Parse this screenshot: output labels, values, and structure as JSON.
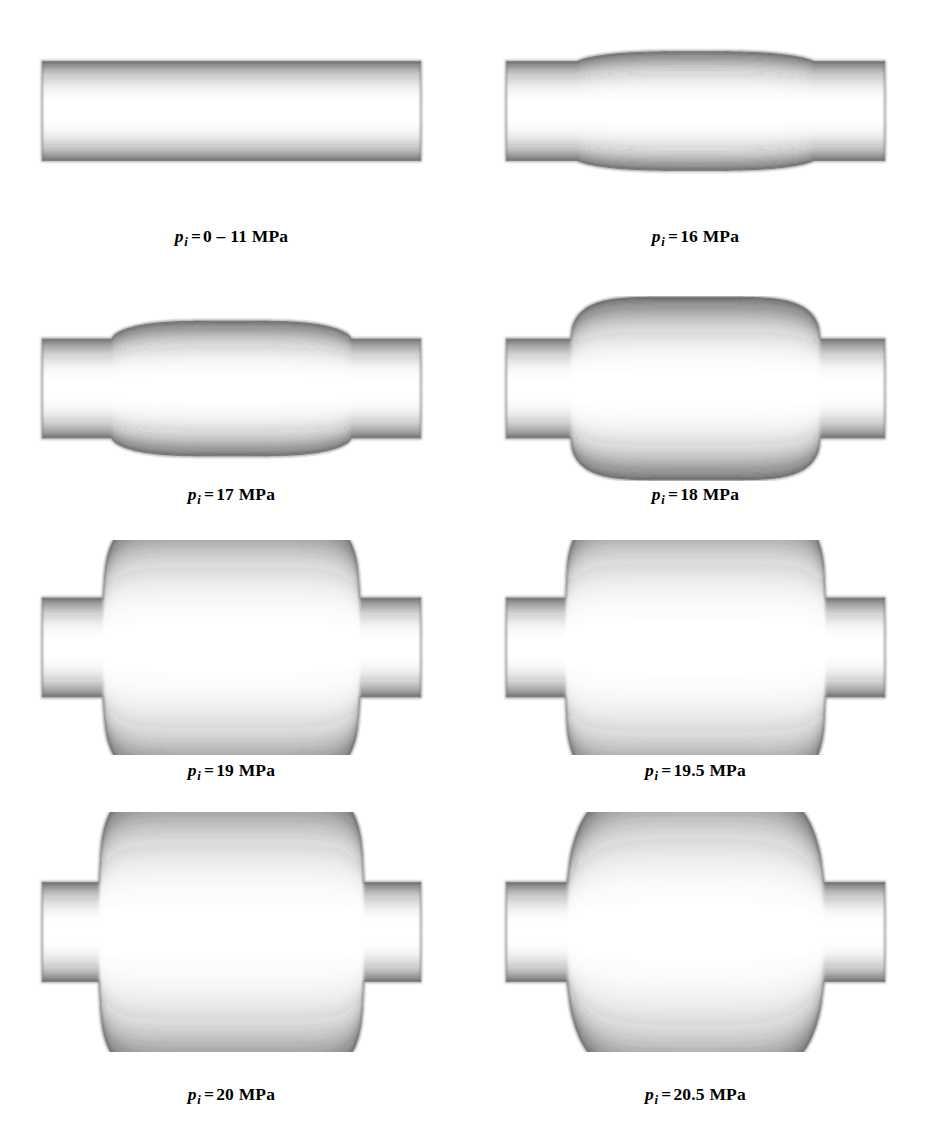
{
  "figure": {
    "kind": "tube-bulge-simulation-grid",
    "columns": 2,
    "rows": 4,
    "background_color": "#ffffff",
    "ink_color": "#2b2b2b"
  },
  "chart_data": {
    "type": "diagram-series",
    "title": "",
    "xlabel": "",
    "ylabel": "",
    "quantity_symbol": "p",
    "quantity_subscript": "i",
    "unit": "MPa",
    "categories": [
      "0 – 11",
      "16",
      "17",
      "18",
      "19",
      "19.5",
      "20",
      "20.5"
    ],
    "values": [
      0,
      16,
      17,
      18,
      19,
      19.5,
      20,
      20.5
    ],
    "bulge_half_height_px": [
      0,
      10,
      18,
      42,
      80,
      86,
      92,
      100
    ],
    "bulge_half_width_px": [
      0,
      118,
      120,
      125,
      128,
      130,
      132,
      128
    ]
  },
  "panels": [
    {
      "id": "p0",
      "symbol": "p",
      "subscript": "i",
      "equals": "=",
      "value": "0 – 11",
      "unit": "MPa",
      "caption": "p i = 0 – 11 MPa",
      "pressure_mpa": 0,
      "shape": "straight",
      "bulge_half_height": 0,
      "bulge_half_width": 0,
      "neck_width": 0,
      "tube_half_height": 50,
      "flat_top": 0
    },
    {
      "id": "p16",
      "symbol": "p",
      "subscript": "i",
      "equals": "=",
      "value": "16",
      "unit": "MPa",
      "caption": "p i = 16 MPa",
      "pressure_mpa": 16,
      "shape": "slight-bulge",
      "bulge_half_height": 10,
      "bulge_half_width": 118,
      "neck_width": 30,
      "tube_half_height": 50,
      "flat_top": 80
    },
    {
      "id": "p17",
      "symbol": "p",
      "subscript": "i",
      "equals": "=",
      "value": "17",
      "unit": "MPa",
      "caption": "p i = 17 MPa",
      "pressure_mpa": 17,
      "shape": "small-bulge",
      "bulge_half_height": 18,
      "bulge_half_width": 120,
      "neck_width": 34,
      "tube_half_height": 50,
      "flat_top": 70
    },
    {
      "id": "p18",
      "symbol": "p",
      "subscript": "i",
      "equals": "=",
      "value": "18",
      "unit": "MPa",
      "caption": "p i = 18 MPa",
      "pressure_mpa": 18,
      "shape": "medium-bulge",
      "bulge_half_height": 42,
      "bulge_half_width": 125,
      "neck_width": 40,
      "tube_half_height": 50,
      "flat_top": 46
    },
    {
      "id": "p19",
      "symbol": "p",
      "subscript": "i",
      "equals": "=",
      "value": "19",
      "unit": "MPa",
      "caption": "p i = 19 MPa",
      "pressure_mpa": 19,
      "shape": "large-bulge",
      "bulge_half_height": 80,
      "bulge_half_width": 128,
      "neck_width": 46,
      "tube_half_height": 50,
      "flat_top": 24
    },
    {
      "id": "p195",
      "symbol": "p",
      "subscript": "i",
      "equals": "=",
      "value": "19.5",
      "unit": "MPa",
      "caption": "p i = 19.5 MPa",
      "pressure_mpa": 19.5,
      "shape": "large-bulge",
      "bulge_half_height": 86,
      "bulge_half_width": 130,
      "neck_width": 48,
      "tube_half_height": 50,
      "flat_top": 20
    },
    {
      "id": "p20",
      "symbol": "p",
      "subscript": "i",
      "equals": "=",
      "value": "20",
      "unit": "MPa",
      "caption": "p i = 20 MPa",
      "pressure_mpa": 20,
      "shape": "very-large-bulge",
      "bulge_half_height": 92,
      "bulge_half_width": 132,
      "neck_width": 50,
      "tube_half_height": 50,
      "flat_top": 16
    },
    {
      "id": "p205",
      "symbol": "p",
      "subscript": "i",
      "equals": "=",
      "value": "20.5",
      "unit": "MPa",
      "caption": "p i = 20.5 MPa",
      "pressure_mpa": 20.5,
      "shape": "elongated-bulge",
      "bulge_half_height": 100,
      "bulge_half_width": 128,
      "neck_width": 52,
      "tube_half_height": 50,
      "flat_top": 60
    }
  ]
}
